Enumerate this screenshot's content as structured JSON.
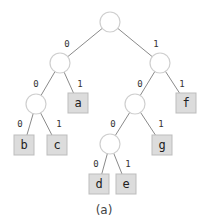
{
  "diagram": {
    "type": "binary-tree",
    "caption": "(a)",
    "colors": {
      "edge": "#8a8a8a",
      "circle_stroke": "#cfcfcf",
      "leaf_fill": "#dcdcdc",
      "leaf_stroke": "#bdbdbd"
    },
    "nodes": [
      {
        "id": "root",
        "kind": "internal",
        "x": 110,
        "y": 22
      },
      {
        "id": "n0",
        "kind": "internal",
        "x": 60,
        "y": 63
      },
      {
        "id": "n1",
        "kind": "internal",
        "x": 160,
        "y": 63
      },
      {
        "id": "n00",
        "kind": "internal",
        "x": 36,
        "y": 104
      },
      {
        "id": "a",
        "kind": "leaf",
        "label": "a",
        "x": 78,
        "y": 103
      },
      {
        "id": "n10",
        "kind": "internal",
        "x": 135,
        "y": 104
      },
      {
        "id": "f",
        "kind": "leaf",
        "label": "f",
        "x": 186,
        "y": 103
      },
      {
        "id": "b",
        "kind": "leaf",
        "label": "b",
        "x": 24,
        "y": 145
      },
      {
        "id": "c",
        "kind": "leaf",
        "label": "c",
        "x": 57,
        "y": 145
      },
      {
        "id": "n100",
        "kind": "internal",
        "x": 110,
        "y": 144
      },
      {
        "id": "g",
        "kind": "leaf",
        "label": "g",
        "x": 162,
        "y": 145
      },
      {
        "id": "d",
        "kind": "leaf",
        "label": "d",
        "x": 99,
        "y": 184
      },
      {
        "id": "e",
        "kind": "leaf",
        "label": "e",
        "x": 126,
        "y": 184
      }
    ],
    "edges": [
      {
        "from": "root",
        "to": "n0",
        "label": "0",
        "lx": 67,
        "ly": 44
      },
      {
        "from": "root",
        "to": "n1",
        "label": "1",
        "lx": 156,
        "ly": 44
      },
      {
        "from": "n0",
        "to": "n00",
        "label": "0",
        "lx": 36,
        "ly": 84
      },
      {
        "from": "n0",
        "to": "a",
        "label": "1",
        "lx": 80,
        "ly": 84
      },
      {
        "from": "n1",
        "to": "n10",
        "label": "0",
        "lx": 140,
        "ly": 84
      },
      {
        "from": "n1",
        "to": "f",
        "label": "1",
        "lx": 182,
        "ly": 84
      },
      {
        "from": "n00",
        "to": "b",
        "label": "0",
        "lx": 20,
        "ly": 124
      },
      {
        "from": "n00",
        "to": "c",
        "label": "1",
        "lx": 59,
        "ly": 124
      },
      {
        "from": "n10",
        "to": "n100",
        "label": "0",
        "lx": 113,
        "ly": 124
      },
      {
        "from": "n10",
        "to": "g",
        "label": "1",
        "lx": 161,
        "ly": 124
      },
      {
        "from": "n100",
        "to": "d",
        "label": "0",
        "lx": 96,
        "ly": 164
      },
      {
        "from": "n100",
        "to": "e",
        "label": "1",
        "lx": 128,
        "ly": 164
      }
    ]
  }
}
